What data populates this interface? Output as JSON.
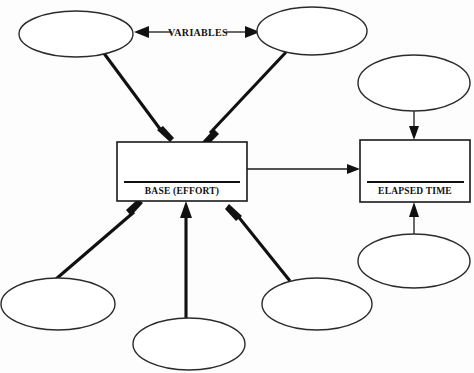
{
  "diagram": {
    "title": "",
    "background_color": "#fdfdfd",
    "stroke_color": "#111111",
    "labels": {
      "variables": "VARIABLES",
      "base": "BASE (EFFORT)",
      "elapsed": "ELAPSED TIME"
    },
    "boxes": [
      {
        "id": "base",
        "label": "BASE (EFFORT)",
        "x": 117,
        "y": 142,
        "width": 130,
        "height": 59
      },
      {
        "id": "elapsed",
        "label": "ELAPSED TIME",
        "x": 360,
        "y": 140,
        "width": 110,
        "height": 62
      }
    ],
    "ellipses": [
      {
        "id": "top-left",
        "label": "",
        "cx": 76,
        "cy": 34,
        "rx": 57,
        "ry": 23
      },
      {
        "id": "top-right",
        "label": "",
        "cx": 312,
        "cy": 31,
        "rx": 55,
        "ry": 24
      },
      {
        "id": "upper-right",
        "label": "",
        "cx": 414,
        "cy": 83,
        "rx": 56,
        "ry": 28
      },
      {
        "id": "mid-right",
        "label": "",
        "cx": 414,
        "cy": 261,
        "rx": 56,
        "ry": 27
      },
      {
        "id": "bottom-left",
        "label": "",
        "cx": 58,
        "cy": 304,
        "rx": 57,
        "ry": 26
      },
      {
        "id": "bottom-center",
        "label": "",
        "cx": 189,
        "cy": 344,
        "rx": 56,
        "ry": 26
      },
      {
        "id": "bottom-right",
        "label": "",
        "cx": 317,
        "cy": 304,
        "rx": 55,
        "ry": 26
      }
    ],
    "connections": [
      {
        "id": "variables-left",
        "from": "variables-label",
        "to": "top-left",
        "style": "double-arrow",
        "weight": "thin"
      },
      {
        "id": "variables-right",
        "from": "variables-label",
        "to": "top-right",
        "style": "double-arrow",
        "weight": "thin"
      },
      {
        "id": "topleft-to-base",
        "from": "top-left",
        "to": "base",
        "style": "arrow",
        "weight": "thick"
      },
      {
        "id": "topright-to-base",
        "from": "top-right",
        "to": "base",
        "style": "arrow",
        "weight": "thick"
      },
      {
        "id": "bottomleft-to-base",
        "from": "bottom-left",
        "to": "base",
        "style": "arrow",
        "weight": "thick"
      },
      {
        "id": "bottomcenter-to-base",
        "from": "bottom-center",
        "to": "base",
        "style": "arrow",
        "weight": "thick"
      },
      {
        "id": "bottomright-to-base",
        "from": "bottom-right",
        "to": "base",
        "style": "arrow",
        "weight": "thick"
      },
      {
        "id": "base-to-elapsed",
        "from": "base",
        "to": "elapsed",
        "style": "arrow",
        "weight": "thin"
      },
      {
        "id": "upperright-to-elapsed",
        "from": "upper-right",
        "to": "elapsed",
        "style": "arrow",
        "weight": "thin"
      },
      {
        "id": "midright-to-elapsed",
        "from": "mid-right",
        "to": "elapsed",
        "style": "arrow",
        "weight": "thin"
      }
    ]
  }
}
